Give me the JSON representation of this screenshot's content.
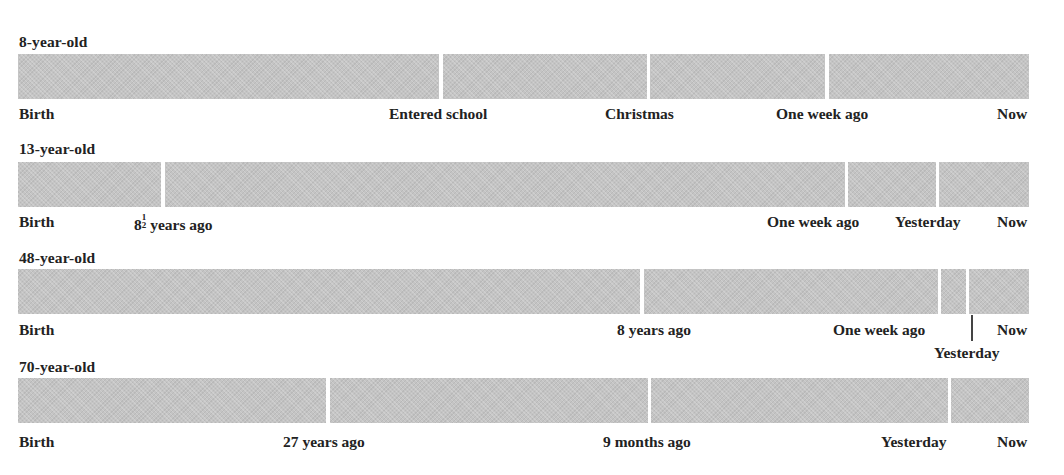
{
  "diagram": {
    "type": "timeline-comparison",
    "bar_color": "#c4c4c4",
    "rows": [
      {
        "title": "8-year-old",
        "segment_breaks_px": [
          440,
          647,
          826
        ],
        "labels": [
          {
            "text": "Birth",
            "x": 19
          },
          {
            "text": "Entered school",
            "x": 389
          },
          {
            "text": "Christmas",
            "x": 605
          },
          {
            "text": "One week ago",
            "x": 776
          },
          {
            "text": "Now",
            "x": 997
          }
        ]
      },
      {
        "title": "13-year-old",
        "segment_breaks_px": [
          162,
          845,
          936
        ],
        "labels": [
          {
            "text": "Birth",
            "x": 19
          },
          {
            "text": "8",
            "x": 134,
            "fraction": {
              "num": "1",
              "den": "2"
            },
            "suffix": " years ago"
          },
          {
            "text": "One week ago",
            "x": 767
          },
          {
            "text": "Yesterday",
            "x": 895
          },
          {
            "text": "Now",
            "x": 997
          }
        ]
      },
      {
        "title": "48-year-old",
        "segment_breaks_px": [
          642,
          938,
          967
        ],
        "labels": [
          {
            "text": "Birth",
            "x": 19
          },
          {
            "text": "8 years ago",
            "x": 617
          },
          {
            "text": "One week ago",
            "x": 833
          },
          {
            "text": "Now",
            "x": 997
          },
          {
            "text": "Yesterday",
            "x": 934,
            "below": true
          }
        ],
        "tick_x": 972
      },
      {
        "title": "70-year-old",
        "segment_breaks_px": [
          327,
          648,
          948
        ],
        "labels": [
          {
            "text": "Birth",
            "x": 19
          },
          {
            "text": "27 years ago",
            "x": 283
          },
          {
            "text": "9 months ago",
            "x": 603
          },
          {
            "text": "Yesterday",
            "x": 881
          },
          {
            "text": "Now",
            "x": 997
          }
        ]
      }
    ]
  },
  "rows": {
    "r0": {
      "title": "8-year-old",
      "l0": "Birth",
      "l1": "Entered school",
      "l2": "Christmas",
      "l3": "One week ago",
      "l4": "Now"
    },
    "r1": {
      "title": "13-year-old",
      "l0": "Birth",
      "l1_whole": "8",
      "l1_num": "1",
      "l1_den": "2",
      "l1_suffix": " years ago",
      "l2": "One week ago",
      "l3": "Yesterday",
      "l4": "Now"
    },
    "r2": {
      "title": "48-year-old",
      "l0": "Birth",
      "l1": "8 years ago",
      "l2": "One week ago",
      "l3": "Now",
      "l4": "Yesterday"
    },
    "r3": {
      "title": "70-year-old",
      "l0": "Birth",
      "l1": "27 years ago",
      "l2": "9 months ago",
      "l3": "Yesterday",
      "l4": "Now"
    }
  }
}
